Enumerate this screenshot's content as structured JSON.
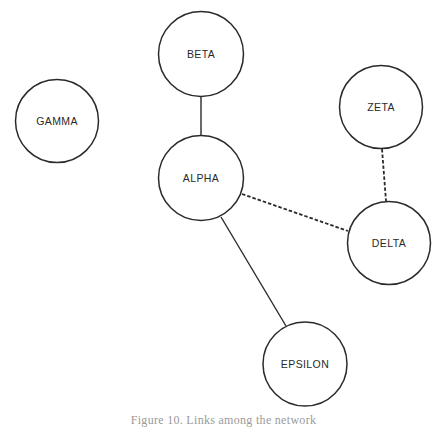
{
  "diagram": {
    "nodes": [
      {
        "id": "beta",
        "label": "BETA",
        "cx": 201,
        "cy": 54,
        "r": 43
      },
      {
        "id": "gamma",
        "label": "GAMMA",
        "cx": 57,
        "cy": 121,
        "r": 42
      },
      {
        "id": "alpha",
        "label": "ALPHA",
        "cx": 201,
        "cy": 178,
        "r": 43
      },
      {
        "id": "zeta",
        "label": "ZETA",
        "cx": 381,
        "cy": 107,
        "r": 42
      },
      {
        "id": "delta",
        "label": "DELTA",
        "cx": 389,
        "cy": 243,
        "r": 42
      },
      {
        "id": "epsilon",
        "label": "EPSILON",
        "cx": 305,
        "cy": 364,
        "r": 42
      }
    ],
    "edges": [
      {
        "from": "beta",
        "to": "alpha",
        "style": "solid"
      },
      {
        "from": "alpha",
        "to": "delta",
        "style": "dashed"
      },
      {
        "from": "zeta",
        "to": "delta",
        "style": "dashed"
      },
      {
        "from": "alpha",
        "to": "epsilon",
        "style": "solid"
      }
    ],
    "caption": "Figure 10. Links among the network"
  }
}
